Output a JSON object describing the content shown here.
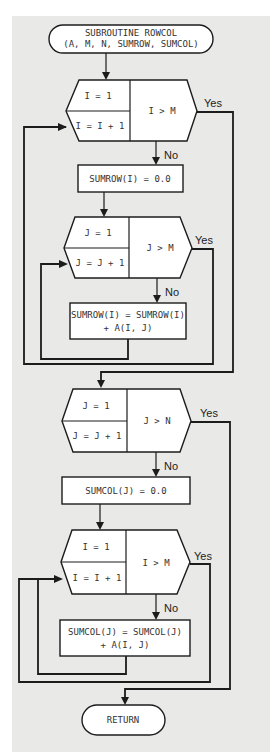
{
  "colors": {
    "background": "#e9e9e7",
    "stroke": "#1c1c1c",
    "box_fill": "#ffffff"
  },
  "start": {
    "line1": "SUBROUTINE ROWCOL",
    "line2": "(A, M, N, SUMROW, SUMCOL)"
  },
  "loop1": {
    "init": "I = 1",
    "incr": "I = I + 1",
    "test": "I > M",
    "yes": "Yes",
    "no": "No"
  },
  "box1": {
    "text": "SUMROW(I) = 0.0"
  },
  "loop2": {
    "init": "J = 1",
    "incr": "J = J + 1",
    "test": "J > M",
    "yes": "Yes",
    "no": "No"
  },
  "box2": {
    "line1": "SUMROW(I) = SUMROW(I)",
    "line2": "+ A(I, J)"
  },
  "loop3": {
    "init": "J = 1",
    "incr": "J = J + 1",
    "test": "J > N",
    "yes": "Yes",
    "no": "No"
  },
  "box3": {
    "text": "SUMCOL(J) = 0.0"
  },
  "loop4": {
    "init": "I = 1",
    "incr": "I = I + 1",
    "test": "I > M",
    "yes": "Yes",
    "no": "No"
  },
  "box4": {
    "line1": "SUMCOL(J) = SUMCOL(J)",
    "line2": "+ A(I, J)"
  },
  "end": {
    "text": "RETURN"
  }
}
